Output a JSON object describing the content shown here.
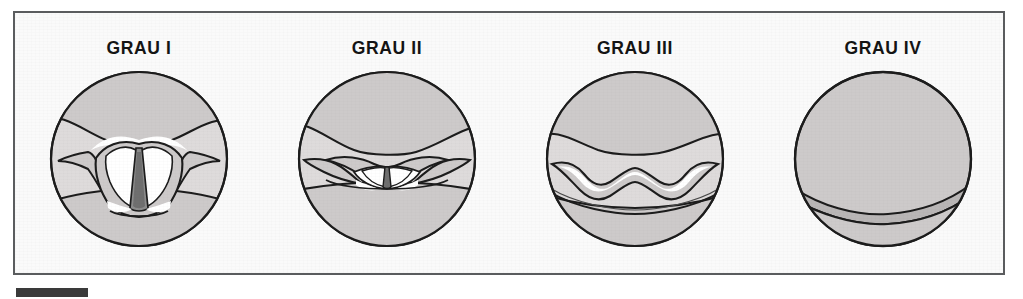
{
  "figure": {
    "name": "cormack-lehane-laryngoscopy-grades",
    "caption_bar_present": true
  },
  "colors": {
    "frame_border": "#5a5c5e",
    "plate_background": "#fafafa",
    "tissue_fill": "#cdcaca",
    "tissue_fill_light": "#dedbdb",
    "outline": "#1c1c1c",
    "highlight": "#ffffff",
    "airway_dark": "#6f6f6f",
    "label_text": "#141414",
    "caption_bar": "#3a3a3a"
  },
  "panels": [
    {
      "id": "grade-1",
      "label": "GRAU I",
      "view": "full glottic aperture visible with vocal cords and posterior commissure"
    },
    {
      "id": "grade-2",
      "label": "GRAU II",
      "view": "only posterior portion of glottis visible behind epiglottis"
    },
    {
      "id": "grade-3",
      "label": "GRAU III",
      "view": "only epiglottis visible, no glottic structures"
    },
    {
      "id": "grade-4",
      "label": "GRAU IV",
      "view": "neither glottis nor epiglottis visible, soft palate only"
    }
  ]
}
